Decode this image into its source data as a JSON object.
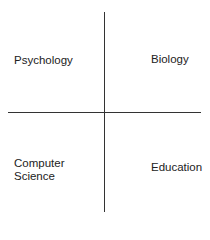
{
  "diagram": {
    "type": "quadrant",
    "quadrants": {
      "top_left": "Psychology",
      "top_right": "Biology",
      "bottom_left": "Computer Science",
      "bottom_right": "Education"
    },
    "colors": {
      "line": "#333333",
      "text": "#222222",
      "background": "#ffffff"
    }
  }
}
